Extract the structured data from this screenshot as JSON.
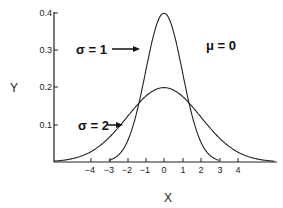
{
  "chart_data": {
    "type": "line",
    "title": "",
    "xlabel": "X",
    "ylabel": "Y",
    "xlim": [
      -6,
      6
    ],
    "ylim": [
      0,
      0.4
    ],
    "x_ticks": [
      "-4",
      "-3",
      "-2",
      "-1",
      "0",
      "1",
      "2",
      "3",
      "4"
    ],
    "y_ticks": [
      "0.1",
      "0.2",
      "0.3",
      "0.4"
    ],
    "grid": false,
    "legend": "none",
    "series": [
      {
        "name": "σ = 1",
        "mean": 0,
        "sd": 1,
        "peak": 0.399
      },
      {
        "name": "σ = 2",
        "mean": 0,
        "sd": 2,
        "peak": 0.199
      }
    ],
    "annotations": [
      {
        "text": "σ = 1",
        "arrow": "right",
        "target_series": "σ = 1"
      },
      {
        "text": "σ = 2",
        "arrow": "right",
        "target_series": "σ = 2"
      },
      {
        "text": "μ = 0"
      }
    ]
  },
  "labels": {
    "x_axis": "X",
    "y_axis": "Y",
    "sigma1": "σ = 1",
    "sigma2": "σ = 2",
    "mu": "μ = 0",
    "xticks": [
      "−4",
      "−3",
      "−2",
      "−1",
      "0",
      "1",
      "2",
      "3",
      "4"
    ],
    "yticks": [
      "0.1",
      "0.2",
      "0.3",
      "0.4"
    ]
  }
}
